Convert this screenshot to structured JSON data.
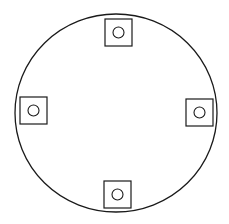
{
  "diagram": {
    "canvas": {
      "width": 229,
      "height": 224,
      "background": "#ffffff"
    },
    "stroke_color": "#1a1a1a",
    "outer_circle": {
      "cx": 116,
      "cy": 113,
      "rx": 101,
      "ry": 99
    },
    "squares": [
      {
        "position": "top",
        "x": 105,
        "y": 19,
        "size": 27
      },
      {
        "position": "left",
        "x": 20,
        "y": 97,
        "size": 27
      },
      {
        "position": "right",
        "x": 186,
        "y": 99,
        "size": 27
      },
      {
        "position": "bottom",
        "x": 104,
        "y": 181,
        "size": 27
      }
    ],
    "inner_circle_radius": 5.5
  }
}
